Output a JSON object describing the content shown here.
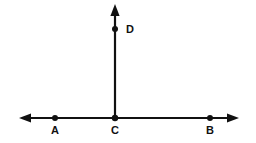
{
  "figure": {
    "type": "geometry-diagram",
    "background_color": "#ffffff",
    "stroke_color": "#111111",
    "canvas": {
      "width": 256,
      "height": 143
    },
    "lines": [
      {
        "name": "line-AB",
        "kind": "double-arrow-line",
        "x1": 22,
        "y1": 118,
        "x2": 236,
        "y2": 118,
        "stroke_width": 2.2,
        "arrow_start": true,
        "arrow_end": true
      },
      {
        "name": "ray-CD",
        "kind": "single-arrow-ray",
        "x1": 115,
        "y1": 118,
        "x2": 115,
        "y2": 10,
        "stroke_width": 2.2,
        "arrow_start": false,
        "arrow_end": true
      }
    ],
    "points": [
      {
        "id": "A",
        "label": "A",
        "x": 55,
        "y": 118,
        "radius": 3.0,
        "label_x": 48,
        "label_y": 123
      },
      {
        "id": "C",
        "label": "C",
        "x": 115,
        "y": 118,
        "radius": 3.2,
        "label_x": 108,
        "label_y": 123
      },
      {
        "id": "B",
        "label": "B",
        "x": 210,
        "y": 118,
        "radius": 3.0,
        "label_x": 203,
        "label_y": 123
      },
      {
        "id": "D",
        "label": "D",
        "x": 115,
        "y": 29,
        "radius": 3.0,
        "label_x": 126,
        "label_y": 24
      }
    ]
  },
  "labels": {
    "a": "A",
    "b": "B",
    "c": "C",
    "d": "D"
  }
}
